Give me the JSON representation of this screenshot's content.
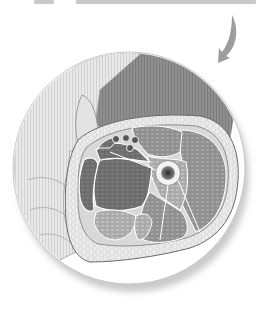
{
  "image": {
    "subject": "cross-section of thigh held by hand, inside circular inset",
    "palette": {
      "background": "#ffffff",
      "skin_light": "#e6e6e6",
      "skin_stripe": "#d4d4d4",
      "thigh_dark": "#8a8a8a",
      "fat": "#e9e9e9",
      "muscle_dark": "#6f6f6f",
      "muscle_mid": "#9a9a9a",
      "muscle_light": "#b8b8b8",
      "outline": "#5a5a5a",
      "bone_ring": "#f2f2f2",
      "marrow": "#3a3a3a",
      "arrow": "#9d9d9d",
      "shadow": "#bdbdbd"
    },
    "inset_circle": {
      "cx": 129,
      "cy": 168,
      "r": 116
    },
    "femur": {
      "cx": 168,
      "cy": 173,
      "r": 12
    },
    "vessels": [
      {
        "cx": 116,
        "cy": 139,
        "r": 3.5
      },
      {
        "cx": 126,
        "cy": 138,
        "r": 3.5
      },
      {
        "cx": 135,
        "cy": 140,
        "r": 3.5
      },
      {
        "cx": 130,
        "cy": 148,
        "r": 3.5
      }
    ],
    "arrow": {
      "direction": "curved-down-left"
    }
  },
  "caption": {
    "visible": true,
    "note": "cropped line of text at top edge, illegible"
  }
}
